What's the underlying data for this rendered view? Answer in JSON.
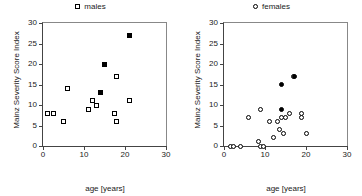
{
  "figure": {
    "panels": [
      {
        "id": "males",
        "legend_label": "males",
        "legend_marker": "open-square",
        "xlabel": "age [years]",
        "ylabel": "Mainz Severity Score Index"
      },
      {
        "id": "females",
        "legend_label": "females",
        "legend_marker": "open-circle",
        "xlabel": "age [years]",
        "ylabel": "Mainz Severity Score Index"
      }
    ]
  },
  "axes": {
    "x_ticks": [
      0,
      10,
      20,
      30
    ],
    "y_ticks": [
      0,
      5,
      10,
      15,
      20,
      25,
      30
    ],
    "xlim": [
      0,
      30
    ],
    "ylim": [
      0,
      30
    ]
  },
  "chart_data": [
    {
      "type": "scatter",
      "title": "males",
      "xlabel": "age [years]",
      "ylabel": "Mainz Severity Score Index",
      "xlim": [
        0,
        30
      ],
      "ylim": [
        0,
        30
      ],
      "xticks": [
        0,
        10,
        20,
        30
      ],
      "yticks": [
        0,
        5,
        10,
        15,
        20,
        25,
        30
      ],
      "grid": false,
      "legend_position": "top-center",
      "series": [
        {
          "name": "males",
          "marker": "open-square",
          "filled": false,
          "points": [
            {
              "x": 1.0,
              "y": 8
            },
            {
              "x": 2.5,
              "y": 8
            },
            {
              "x": 5.0,
              "y": 6
            },
            {
              "x": 6.0,
              "y": 14
            },
            {
              "x": 11.0,
              "y": 9
            },
            {
              "x": 12.0,
              "y": 11
            },
            {
              "x": 13.0,
              "y": 10
            },
            {
              "x": 17.5,
              "y": 8
            },
            {
              "x": 18.0,
              "y": 6
            },
            {
              "x": 18.0,
              "y": 17
            },
            {
              "x": 21.0,
              "y": 11
            }
          ]
        },
        {
          "name": "males-filled",
          "marker": "filled-square",
          "filled": true,
          "points": [
            {
              "x": 14.0,
              "y": 13
            },
            {
              "x": 15.0,
              "y": 20
            },
            {
              "x": 21.0,
              "y": 27
            }
          ]
        }
      ]
    },
    {
      "type": "scatter",
      "title": "females",
      "xlabel": "age [years]",
      "ylabel": "Mainz Severity Score Index",
      "xlim": [
        0,
        30
      ],
      "ylim": [
        0,
        30
      ],
      "xticks": [
        0,
        10,
        20,
        30
      ],
      "yticks": [
        0,
        5,
        10,
        15,
        20,
        25,
        30
      ],
      "grid": false,
      "legend_position": "top-center",
      "series": [
        {
          "name": "females",
          "marker": "open-circle",
          "filled": false,
          "points": [
            {
              "x": 1.5,
              "y": 0
            },
            {
              "x": 2.2,
              "y": 0
            },
            {
              "x": 4.0,
              "y": 0
            },
            {
              "x": 6.0,
              "y": 7
            },
            {
              "x": 8.5,
              "y": 1
            },
            {
              "x": 9.0,
              "y": 0
            },
            {
              "x": 9.6,
              "y": 0
            },
            {
              "x": 9.0,
              "y": 9
            },
            {
              "x": 11.0,
              "y": 6
            },
            {
              "x": 12.0,
              "y": 2
            },
            {
              "x": 13.0,
              "y": 6
            },
            {
              "x": 13.5,
              "y": 4
            },
            {
              "x": 14.0,
              "y": 7
            },
            {
              "x": 14.5,
              "y": 3
            },
            {
              "x": 15.0,
              "y": 7
            },
            {
              "x": 16.0,
              "y": 8
            },
            {
              "x": 17.0,
              "y": 17
            },
            {
              "x": 19.0,
              "y": 8
            },
            {
              "x": 19.0,
              "y": 7
            },
            {
              "x": 20.0,
              "y": 3
            }
          ]
        },
        {
          "name": "females-filled",
          "marker": "filled-circle",
          "filled": true,
          "points": [
            {
              "x": 14.0,
              "y": 15
            },
            {
              "x": 14.0,
              "y": 9
            },
            {
              "x": 17.3,
              "y": 17
            }
          ]
        }
      ]
    }
  ]
}
